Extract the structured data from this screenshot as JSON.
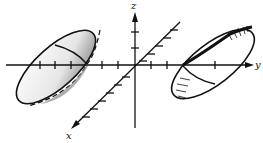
{
  "diagram": {
    "axes": {
      "x_label": "x",
      "y_label": "y",
      "z_label": "z"
    },
    "colors": {
      "line": "#111111",
      "shade": "#9a9a9a",
      "background": "#ffffff"
    },
    "surfaces": [
      {
        "name": "left-sheet",
        "side": "negative-y"
      },
      {
        "name": "right-sheet",
        "side": "positive-y"
      }
    ]
  }
}
